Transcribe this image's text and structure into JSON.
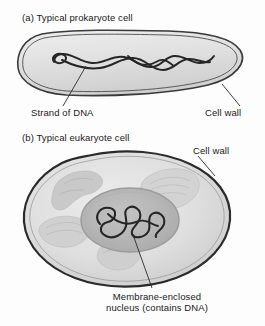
{
  "figure": {
    "background_color": "#fdfdfd",
    "line_color": "#2b2b2b",
    "text_color": "#1a1a1a"
  },
  "panel_a": {
    "caption": "(a) Typical prokaryote cell",
    "cell_type": "prokaryote",
    "cell_fill": "#e3e3e3",
    "cell_wall_color": "#3a3a3a",
    "labels": [
      {
        "text": "Strand of DNA",
        "points_to": "dna-strand"
      },
      {
        "text": "Cell wall",
        "points_to": "prokaryote-cell-wall"
      }
    ],
    "structures": [
      {
        "name": "dna-strand",
        "description": "tangled looped DNA strand"
      },
      {
        "name": "cell-wall",
        "description": "double-line capsule wall"
      }
    ]
  },
  "panel_b": {
    "caption": "(b) Typical eukaryote cell",
    "cell_type": "eukaryote",
    "cell_fill": "#dcdcdc",
    "cytoplasm_fill": "#d4d4d4",
    "nucleus_fill": "#b8b8b8",
    "cell_wall_color": "#2b2b2b",
    "labels": [
      {
        "text": "Cell wall",
        "points_to": "eukaryote-cell-wall"
      },
      {
        "text_line1": "Membrane-enclosed",
        "text_line2": "nucleus (contains DNA)",
        "points_to": "nucleus"
      }
    ],
    "structures": [
      {
        "name": "nucleus",
        "description": "central oval membrane-enclosed nucleus with DNA"
      },
      {
        "name": "mitochondrion",
        "description": "kidney-bean shaped organelle"
      },
      {
        "name": "endoplasmic-reticulum",
        "description": "folded organelle"
      },
      {
        "name": "organelle",
        "description": "faint cytoplasmic organelle"
      }
    ]
  }
}
